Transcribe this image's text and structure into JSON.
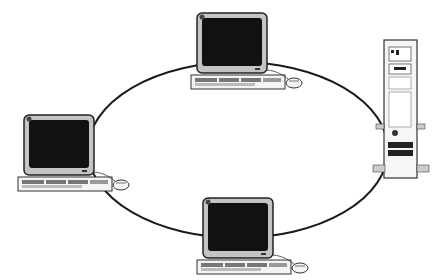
{
  "diagram": {
    "type": "ring-network-topology",
    "colors": {
      "background": "#ffffff",
      "line": "#1a1a1a",
      "screen": "#111111",
      "bezel": "#b8b8b8",
      "case": "#f2f2f2"
    },
    "nodes": [
      {
        "id": "workstation-top",
        "kind": "workstation"
      },
      {
        "id": "workstation-left",
        "kind": "workstation"
      },
      {
        "id": "workstation-bottom",
        "kind": "workstation"
      },
      {
        "id": "server-tower",
        "kind": "tower-server"
      }
    ],
    "links": "ring"
  }
}
